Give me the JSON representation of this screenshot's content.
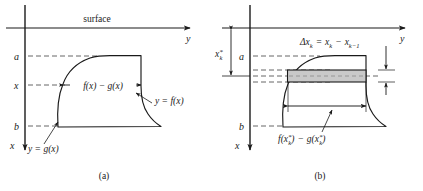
{
  "figure": {
    "type": "math-diagram",
    "background_color": "#ffffff",
    "ink_color": "#1a1a1a",
    "dash_color": "#666666",
    "strip_fill_color": "#c9c9c9"
  },
  "panel_a": {
    "caption": "(a)",
    "axis_top_label": "surface",
    "axis_y_label": "y",
    "axis_x_label": "x",
    "tick_labels": [
      "a",
      "x",
      "b"
    ],
    "width_label": "f(x) − g(x)",
    "curve_label_right": "y = f(x)",
    "curve_label_left": "y = g(x)"
  },
  "panel_b": {
    "caption": "(b)",
    "axis_y_label": "y",
    "axis_x_label": "x",
    "tick_labels": [
      "a",
      "b"
    ],
    "star_label": {
      "base": "x",
      "superscript": "*",
      "subscript": "k"
    },
    "delta_label": {
      "text": "Δx",
      "sub1": "k",
      "equals": "=",
      "term1_base": "x",
      "term1_sub": "k",
      "minus": "−",
      "term2_base": "x",
      "term2_sub": "k−1"
    },
    "width_label": {
      "f_base": "f(x",
      "f_sup": "*",
      "f_sub": "k",
      "f_close": ")",
      "minus": "−",
      "g_base": "g(x",
      "g_sup": "*",
      "g_sub": "k",
      "g_close": ")"
    }
  }
}
